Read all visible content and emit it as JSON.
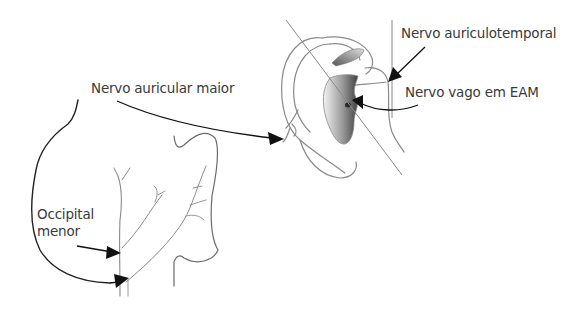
{
  "diagram": {
    "type": "anatomical-illustration",
    "labels": {
      "auriculotemporal": "Nervo auriculotemporal",
      "vago": "Nervo vago em EAM",
      "auricular_maior": "Nervo auricular maior",
      "occipital_line1": "Occipital",
      "occipital_line2": "menor"
    },
    "colors": {
      "text": "#3a3a3a",
      "arrow": "#111111",
      "line": "#8a8a8a",
      "shade_dark": "#555555",
      "shade_light": "#e8e8e8",
      "background": "#ffffff"
    }
  }
}
